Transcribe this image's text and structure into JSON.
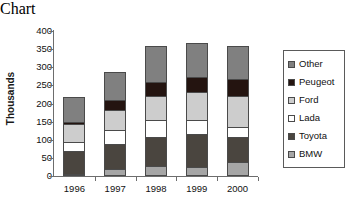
{
  "chart_data": {
    "type": "bar",
    "stacked": true,
    "title": "",
    "xlabel": "",
    "ylabel": "Thousands",
    "categories": [
      "1996",
      "1997",
      "1998",
      "1999",
      "2000"
    ],
    "ylim": [
      0,
      400
    ],
    "yticks": [
      0,
      50,
      100,
      150,
      200,
      250,
      300,
      350,
      400
    ],
    "ytick_labels": [
      "0",
      "50",
      "100",
      "150",
      "200",
      "250",
      "300",
      "350",
      "400"
    ],
    "grid": false,
    "legend_position": "right",
    "stack_order_bottom_to_top": [
      "BMW",
      "Toyota",
      "Lada",
      "Ford",
      "Peugeot",
      "Other"
    ],
    "series": [
      {
        "name": "Other",
        "color": "#808080",
        "values": [
          72,
          80,
          102,
          97,
          92
        ]
      },
      {
        "name": "Peugeot",
        "color": "#241410",
        "values": [
          10,
          32,
          40,
          45,
          50
        ]
      },
      {
        "name": "Ford",
        "color": "#cdcdcd",
        "values": [
          50,
          58,
          70,
          80,
          90
        ]
      },
      {
        "name": "Lada",
        "color": "#ffffff",
        "values": [
          30,
          42,
          50,
          40,
          30
        ]
      },
      {
        "name": "Toyota",
        "color": "#4a453f",
        "values": [
          65,
          72,
          83,
          95,
          70
        ]
      },
      {
        "name": "BMW",
        "color": "#a6a6a6",
        "values": [
          5,
          18,
          27,
          25,
          40
        ]
      }
    ],
    "totals": [
      232,
      302,
      372,
      382,
      372
    ]
  },
  "legend": {
    "items": [
      {
        "label": "Other"
      },
      {
        "label": "Peugeot"
      },
      {
        "label": "Ford"
      },
      {
        "label": "Lada"
      },
      {
        "label": "Toyota"
      },
      {
        "label": "BMW"
      }
    ]
  },
  "colors": {
    "axis": "#6d6d6d",
    "text": "#111111",
    "segment_border": "#4a4a4a",
    "background": "#ffffff"
  }
}
